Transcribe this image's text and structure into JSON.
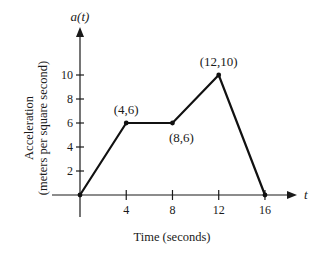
{
  "chart_data": {
    "type": "line",
    "title": "",
    "xlabel": "Time (seconds)",
    "ylabel_lines": [
      "Acceleration",
      "(meters per square second)"
    ],
    "x_axis_variable": "t",
    "y_axis_variable": "a(t)",
    "xlim": [
      0,
      16
    ],
    "ylim": [
      0,
      10
    ],
    "grid": false,
    "x_ticks": [
      4,
      8,
      12,
      16
    ],
    "x_tick_labels": [
      "4",
      "8",
      "12",
      "16"
    ],
    "y_ticks": [
      2,
      4,
      6,
      8,
      10
    ],
    "y_tick_labels": [
      "2",
      "4",
      "6",
      "8",
      "10"
    ],
    "series": [
      {
        "name": "a(t)",
        "x": [
          0,
          4,
          8,
          12,
          16
        ],
        "y": [
          0,
          6,
          6,
          10,
          0
        ]
      }
    ],
    "annotations": [
      {
        "text": "(4,6)",
        "x": 4,
        "y": 6,
        "position": "above"
      },
      {
        "text": "(8,6)",
        "x": 8,
        "y": 6,
        "position": "below-right"
      },
      {
        "text": "(12,10)",
        "x": 12,
        "y": 10,
        "position": "above"
      }
    ],
    "colors": {
      "line": "#111111",
      "axis": "#1a1a1a"
    }
  }
}
